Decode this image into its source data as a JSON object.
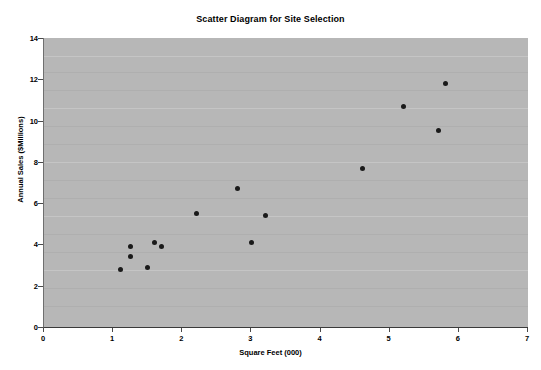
{
  "chart_data": {
    "type": "scatter",
    "title": "Scatter Diagram for Site Selection",
    "xlabel": "Square Feet (000)",
    "ylabel": "Annual Sales ($Millions)",
    "xlim": [
      0,
      7
    ],
    "ylim": [
      0,
      14
    ],
    "xticks": [
      0,
      1,
      2,
      3,
      4,
      5,
      6,
      7
    ],
    "yticks": [
      0,
      2,
      4,
      6,
      8,
      10,
      12,
      14
    ],
    "grid": false,
    "legend": null,
    "plot_background": "#b7b7b7",
    "marker_color": "#1a1a1a",
    "series": [
      {
        "name": "Sites",
        "points": [
          {
            "x": 1.1,
            "y": 2.8
          },
          {
            "x": 1.25,
            "y": 3.4
          },
          {
            "x": 1.25,
            "y": 3.9
          },
          {
            "x": 1.5,
            "y": 2.9
          },
          {
            "x": 1.6,
            "y": 4.1
          },
          {
            "x": 1.7,
            "y": 3.9
          },
          {
            "x": 2.2,
            "y": 5.5
          },
          {
            "x": 2.8,
            "y": 6.7
          },
          {
            "x": 3.0,
            "y": 4.1
          },
          {
            "x": 3.2,
            "y": 5.4
          },
          {
            "x": 4.6,
            "y": 7.7
          },
          {
            "x": 5.2,
            "y": 10.7
          },
          {
            "x": 5.7,
            "y": 9.5
          },
          {
            "x": 5.8,
            "y": 11.8
          }
        ]
      }
    ]
  }
}
